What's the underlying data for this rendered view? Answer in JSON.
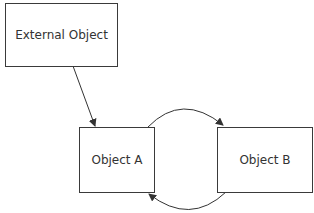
{
  "diagram": {
    "nodes": [
      {
        "id": "external",
        "label": "External Object"
      },
      {
        "id": "a",
        "label": "Object A"
      },
      {
        "id": "b",
        "label": "Object B"
      }
    ],
    "edges": [
      {
        "from": "external",
        "to": "a",
        "style": "straight-arrow"
      },
      {
        "from": "a",
        "to": "b",
        "style": "curved-arrow-top"
      },
      {
        "from": "b",
        "to": "a",
        "style": "curved-arrow-bottom"
      }
    ]
  }
}
